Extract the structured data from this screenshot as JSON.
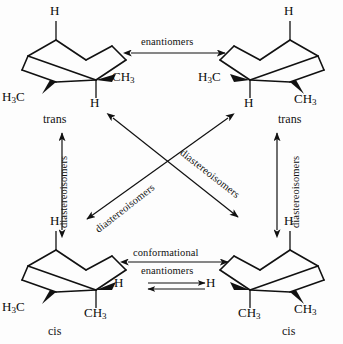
{
  "figure": {
    "background_color": "#fdfdfd",
    "line_color": "#111111"
  },
  "structures": [
    {
      "id": "top-left",
      "config_label": "trans",
      "labels": {
        "axial_top": "H",
        "left_substituent": "H3C",
        "right_substituent": "CH3",
        "axial_bottom": "H"
      }
    },
    {
      "id": "top-right",
      "config_label": "trans",
      "labels": {
        "axial_top": "H",
        "left_substituent": "H3C",
        "right_substituent": "CH3",
        "axial_bottom": "H"
      }
    },
    {
      "id": "bottom-left",
      "config_label": "cis",
      "labels": {
        "axial_top": "H",
        "left_substituent": "H3C",
        "right_substituent": "H",
        "axial_bottom": "CH3"
      }
    },
    {
      "id": "bottom-right",
      "config_label": "cis",
      "labels": {
        "axial_top": "H",
        "left_substituent": "H",
        "right_substituent": "CH3",
        "axial_bottom": "CH3"
      }
    }
  ],
  "relations": {
    "top_horizontal": {
      "label": "enantiomers",
      "arrow": "double-headed"
    },
    "bottom_horizontal": {
      "label_line1": "conformational",
      "label_line2": "enantiomers",
      "arrow": "double-headed",
      "equilibrium_arrow": "equilibrium"
    },
    "left_vertical": {
      "label": "diastereoisomers",
      "arrow": "double-headed"
    },
    "right_vertical": {
      "label": "diastereoisomers",
      "arrow": "double-headed"
    },
    "diagonal_tl_br": {
      "label": "diastereoisomers",
      "arrow": "double-headed"
    },
    "diagonal_tr_bl": {
      "label": "diastereoisomers",
      "arrow": "double-headed"
    }
  }
}
